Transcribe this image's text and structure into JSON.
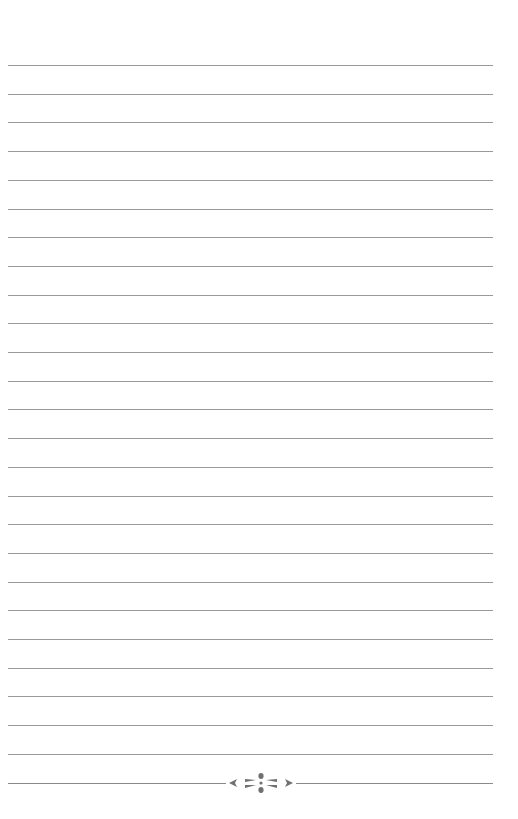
{
  "page": {
    "type": "lined-notebook-page",
    "background": "#ffffff",
    "line_color": "#9a9a9a",
    "line_count": 25,
    "first_line_y": 65,
    "line_spacing": 28.7,
    "footer": {
      "ornament": "floral-divider-icon",
      "ornament_color": "#707070"
    }
  }
}
